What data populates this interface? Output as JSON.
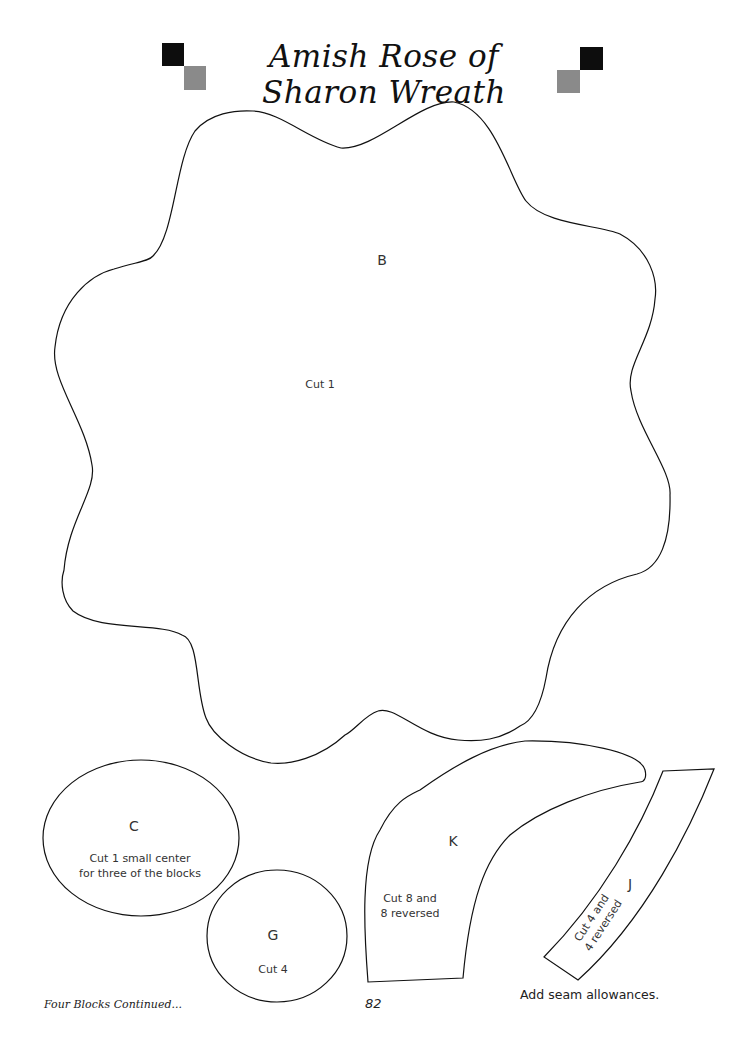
{
  "header": {
    "title": "Amish Rose of Sharon Wreath",
    "colors": {
      "dark_square": "#0d0d0d",
      "gray_square": "#8a8a8a"
    }
  },
  "pieces": {
    "B": {
      "letter": "B",
      "note": "Cut 1"
    },
    "C": {
      "letter": "C",
      "note_line1": "Cut 1 small center",
      "note_line2": "for three of the blocks"
    },
    "G": {
      "letter": "G",
      "note": "Cut 4"
    },
    "K": {
      "letter": "K",
      "note_line1": "Cut 8 and",
      "note_line2": "8 reversed"
    },
    "J": {
      "letter": "J",
      "note_line1": "Cut 4 and",
      "note_line2": "4 reversed"
    }
  },
  "footer": {
    "section": "Four Blocks Continued...",
    "page_number": "82",
    "instruction": "Add seam allowances."
  }
}
